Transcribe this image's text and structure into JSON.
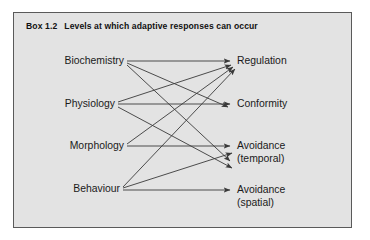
{
  "box": {
    "title_number": "Box 1.2",
    "title_text": "Levels at which adaptive responses can occur",
    "background_color": "#e3e3e3",
    "border_color": "#5a5a5a"
  },
  "diagram": {
    "type": "directed-graph",
    "line_color": "#3a3a3a",
    "left_nodes": [
      {
        "id": "biochemistry",
        "label": "Biochemistry"
      },
      {
        "id": "physiology",
        "label": "Physiology"
      },
      {
        "id": "morphology",
        "label": "Morphology"
      },
      {
        "id": "behaviour",
        "label": "Behaviour"
      }
    ],
    "right_nodes": [
      {
        "id": "regulation",
        "label": "Regulation",
        "sub": ""
      },
      {
        "id": "conformity",
        "label": "Conformity",
        "sub": ""
      },
      {
        "id": "avoidance_temporal",
        "label": "Avoidance",
        "sub": "(temporal)"
      },
      {
        "id": "avoidance_spatial",
        "label": "Avoidance",
        "sub": "(spatial)"
      }
    ],
    "edges": [
      {
        "from": "biochemistry",
        "to": "regulation"
      },
      {
        "from": "biochemistry",
        "to": "conformity"
      },
      {
        "from": "biochemistry",
        "to": "avoidance_temporal"
      },
      {
        "from": "physiology",
        "to": "regulation"
      },
      {
        "from": "physiology",
        "to": "conformity"
      },
      {
        "from": "physiology",
        "to": "avoidance_temporal"
      },
      {
        "from": "morphology",
        "to": "regulation"
      },
      {
        "from": "morphology",
        "to": "avoidance_temporal"
      },
      {
        "from": "behaviour",
        "to": "regulation"
      },
      {
        "from": "behaviour",
        "to": "avoidance_temporal"
      },
      {
        "from": "behaviour",
        "to": "avoidance_spatial"
      }
    ]
  }
}
